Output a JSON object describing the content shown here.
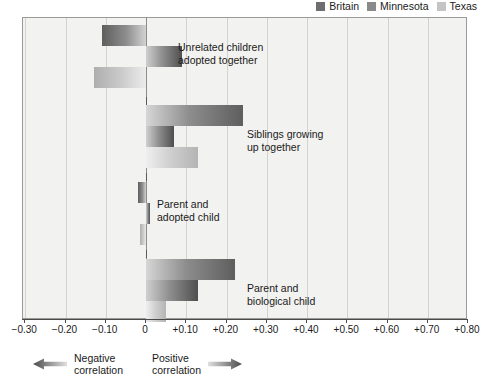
{
  "legend": {
    "items": [
      {
        "label": "Britain",
        "color": "#6e6e6e",
        "key": "britain"
      },
      {
        "label": "Minnesota",
        "color": "#8a8a8a",
        "key": "minnesota"
      },
      {
        "label": "Texas",
        "color": "#c4c4c4",
        "key": "texas"
      }
    ]
  },
  "axis": {
    "ticks": [
      {
        "value": -0.3,
        "label": "−0.30"
      },
      {
        "value": -0.2,
        "label": "−0.20"
      },
      {
        "value": -0.1,
        "label": "−0.10"
      },
      {
        "value": 0.0,
        "label": "0"
      },
      {
        "value": 0.1,
        "label": "+0.10"
      },
      {
        "value": 0.2,
        "label": "+0.20"
      },
      {
        "value": 0.3,
        "label": "+0.30"
      },
      {
        "value": 0.4,
        "label": "+0.40"
      },
      {
        "value": 0.5,
        "label": "+0.50"
      },
      {
        "value": 0.6,
        "label": "+0.60"
      },
      {
        "value": 0.7,
        "label": "+0.70"
      },
      {
        "value": 0.8,
        "label": "+0.80"
      }
    ]
  },
  "annotations": {
    "negative": "Negative\ncorrelation",
    "positive": "Positive\ncorrelation"
  },
  "category_labels": {
    "unrelated": "Unrelated children\nadopted together",
    "siblings": "Siblings growing\nup together",
    "adopted": "Parent and\nadopted child",
    "biological": "Parent and\nbiological child"
  },
  "chart_data": {
    "type": "bar",
    "orientation": "horizontal",
    "title": "",
    "xlabel": "",
    "ylabel": "",
    "xlim": [
      -0.3,
      0.8
    ],
    "grid": true,
    "legend_position": "top-right",
    "categories": [
      "Unrelated children adopted together",
      "Siblings growing up together",
      "Parent and adopted child",
      "Parent and biological child"
    ],
    "series": [
      {
        "name": "Britain",
        "values": [
          -0.11,
          0.24,
          -0.02,
          0.22
        ]
      },
      {
        "name": "Minnesota",
        "values": [
          0.09,
          0.07,
          0.01,
          0.13
        ]
      },
      {
        "name": "Texas",
        "values": [
          -0.13,
          0.13,
          -0.015,
          0.05
        ]
      }
    ]
  }
}
